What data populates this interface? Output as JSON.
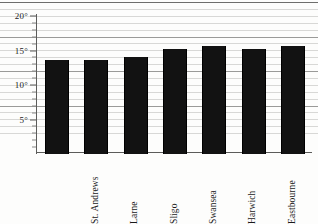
{
  "chart_data": {
    "type": "bar",
    "title": "",
    "subtitle": "",
    "xlabel": "",
    "ylabel": "",
    "categories": [
      "St. Andrews",
      "Larne",
      "Sligo",
      "Swansea",
      "Harwich",
      "Eastbourne",
      "St Austell"
    ],
    "values": [
      13.7,
      13.6,
      14.0,
      15.2,
      15.6,
      15.2,
      15.7
    ],
    "ylim": [
      0,
      20
    ],
    "y_major_ticks": [
      5,
      10,
      15,
      20
    ],
    "y_tick_labels": [
      "5°",
      "10°",
      "15°",
      "20°"
    ],
    "y_minor_tick_step": 1,
    "grid": true,
    "grid_orientation": "horizontal",
    "legend": false,
    "legend_position": "none",
    "bar_color": "#121212",
    "gridline_color": "#d8d8d6",
    "major_gridline_color": "#9a9a98",
    "axis_color": "#5c5c5a",
    "background_color": "#fdfdfc"
  },
  "axes": {
    "y_ticks": [
      {
        "label": "20°",
        "value": 20
      },
      {
        "label": "15°",
        "value": 15
      },
      {
        "label": "10°",
        "value": 10
      },
      {
        "label": "5°",
        "value": 5
      }
    ]
  }
}
